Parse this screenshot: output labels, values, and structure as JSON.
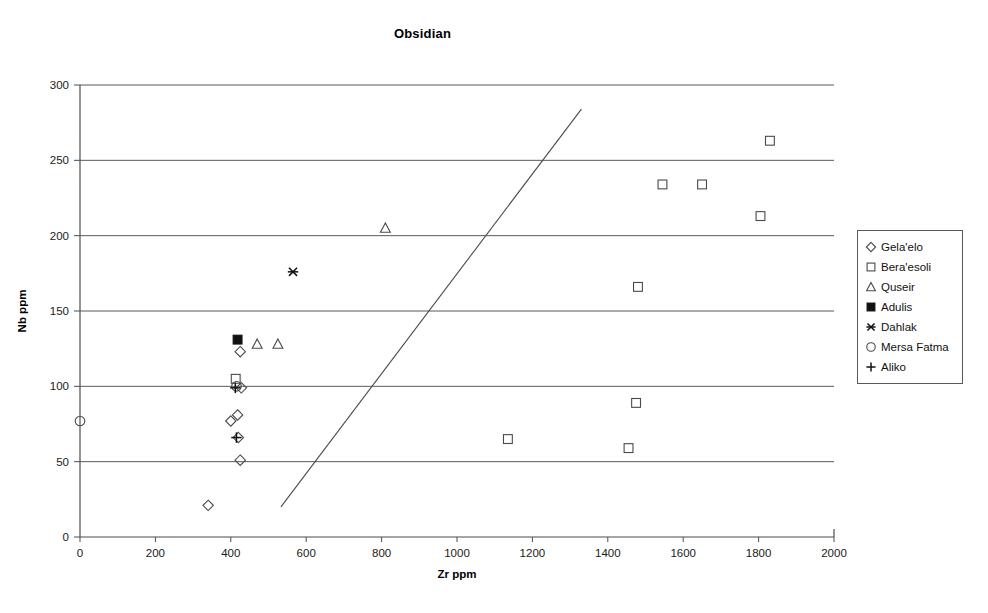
{
  "chart_data": {
    "type": "scatter",
    "title": "Obsidian",
    "xlabel": "Zr ppm",
    "ylabel": "Nb ppm",
    "xlim": [
      0,
      2000
    ],
    "ylim": [
      0,
      300
    ],
    "xticks": [
      0,
      200,
      400,
      600,
      800,
      1000,
      1200,
      1400,
      1600,
      1800,
      2000
    ],
    "yticks": [
      0,
      50,
      100,
      150,
      200,
      250,
      300
    ],
    "grid": "horizontal",
    "legend_position": "right",
    "series": [
      {
        "name": "Gela'elo",
        "marker": "diamond",
        "points": [
          {
            "x": 340,
            "y": 21
          },
          {
            "x": 400,
            "y": 77
          },
          {
            "x": 418,
            "y": 81
          },
          {
            "x": 420,
            "y": 66
          },
          {
            "x": 425,
            "y": 51
          },
          {
            "x": 428,
            "y": 99
          },
          {
            "x": 425,
            "y": 123
          }
        ]
      },
      {
        "name": "Bera'esoli",
        "marker": "square",
        "points": [
          {
            "x": 413,
            "y": 105
          },
          {
            "x": 1135,
            "y": 65
          },
          {
            "x": 1455,
            "y": 59
          },
          {
            "x": 1475,
            "y": 89
          },
          {
            "x": 1480,
            "y": 166
          },
          {
            "x": 1545,
            "y": 234
          },
          {
            "x": 1650,
            "y": 234
          },
          {
            "x": 1805,
            "y": 213
          },
          {
            "x": 1830,
            "y": 263
          }
        ]
      },
      {
        "name": "Quseir",
        "marker": "triangle",
        "points": [
          {
            "x": 470,
            "y": 128
          },
          {
            "x": 525,
            "y": 128
          },
          {
            "x": 810,
            "y": 205
          }
        ]
      },
      {
        "name": "Adulis",
        "marker": "filled-square",
        "points": [
          {
            "x": 418,
            "y": 131
          }
        ]
      },
      {
        "name": "Dahlak",
        "marker": "asterisk",
        "points": [
          {
            "x": 565,
            "y": 176
          }
        ]
      },
      {
        "name": "Mersa Fatma",
        "marker": "circle",
        "points": [
          {
            "x": 0,
            "y": 77
          },
          {
            "x": 415,
            "y": 100
          }
        ]
      },
      {
        "name": "Aliko",
        "marker": "plus",
        "points": [
          {
            "x": 412,
            "y": 99
          },
          {
            "x": 415,
            "y": 66
          }
        ]
      }
    ],
    "trend_line": {
      "x1": 533,
      "y1": 20,
      "x2": 1330,
      "y2": 284
    }
  },
  "legend": {
    "items": [
      {
        "label": "Gela'elo",
        "marker": "diamond"
      },
      {
        "label": "Bera'esoli",
        "marker": "square"
      },
      {
        "label": "Quseir",
        "marker": "triangle"
      },
      {
        "label": "Adulis",
        "marker": "filled-square"
      },
      {
        "label": "Dahlak",
        "marker": "asterisk"
      },
      {
        "label": "Mersa Fatma",
        "marker": "circle"
      },
      {
        "label": "Aliko",
        "marker": "plus"
      }
    ]
  },
  "colors": {
    "axis": "#4d4d4d",
    "grid": "#595959",
    "marker": "#4a4a4a",
    "marker_filled": "#111111",
    "text": "#111111",
    "trend": "#4a4a4a"
  }
}
